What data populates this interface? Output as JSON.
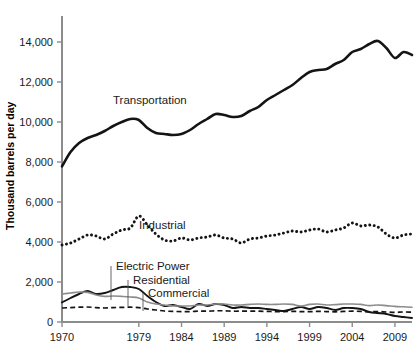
{
  "chart_data": {
    "type": "line",
    "title": "",
    "xlabel": "",
    "ylabel": "Thousand barrels per day",
    "xlim": [
      1970,
      2011
    ],
    "ylim": [
      0,
      15000
    ],
    "ytick_labels": [
      "0",
      "2,000",
      "4,000",
      "6,000",
      "8,000",
      "10,000",
      "12,000",
      "14,000"
    ],
    "ytick_values": [
      0,
      2000,
      4000,
      6000,
      8000,
      10000,
      12000,
      14000
    ],
    "xtick_labels": [
      "1970",
      "1979",
      "1984",
      "1989",
      "1994",
      "1999",
      "2004",
      "2009"
    ],
    "xtick_values": [
      1970,
      1979,
      1984,
      1989,
      1994,
      1999,
      2004,
      2009
    ],
    "grid": false,
    "legend_position": "inline-annotations",
    "x": [
      1970,
      1971,
      1972,
      1973,
      1974,
      1975,
      1976,
      1977,
      1978,
      1979,
      1980,
      1981,
      1982,
      1983,
      1984,
      1985,
      1986,
      1987,
      1988,
      1989,
      1990,
      1991,
      1992,
      1993,
      1994,
      1995,
      1996,
      1997,
      1998,
      1999,
      2000,
      2001,
      2002,
      2003,
      2004,
      2005,
      2006,
      2007,
      2008,
      2009,
      2010,
      2011
    ],
    "series": [
      {
        "name": "Transportation",
        "style": "solid-thick-black",
        "color": "#141414",
        "values": [
          7780,
          8500,
          8950,
          9200,
          9350,
          9550,
          9800,
          10000,
          10150,
          10100,
          9700,
          9450,
          9400,
          9350,
          9400,
          9600,
          9900,
          10150,
          10400,
          10350,
          10250,
          10300,
          10550,
          10750,
          11100,
          11350,
          11600,
          11850,
          12200,
          12500,
          12600,
          12650,
          12900,
          13100,
          13500,
          13650,
          13900,
          14050,
          13700,
          13200,
          13500,
          13350
        ]
      },
      {
        "name": "Industrial",
        "style": "dotted-black",
        "color": "#141414",
        "values": [
          3850,
          3950,
          4150,
          4350,
          4300,
          4150,
          4400,
          4600,
          4700,
          5300,
          4850,
          4400,
          4100,
          4050,
          4200,
          4100,
          4200,
          4250,
          4350,
          4200,
          4150,
          3950,
          4150,
          4200,
          4300,
          4350,
          4450,
          4550,
          4500,
          4600,
          4650,
          4500,
          4600,
          4700,
          4950,
          4800,
          4850,
          4750,
          4400,
          4200,
          4350,
          4400
        ]
      },
      {
        "name": "Electric Power",
        "style": "solid-black",
        "color": "#141414",
        "values": [
          980,
          1200,
          1400,
          1550,
          1400,
          1450,
          1600,
          1750,
          1750,
          1650,
          1300,
          1000,
          800,
          850,
          750,
          650,
          900,
          800,
          900,
          850,
          700,
          750,
          700,
          700,
          650,
          600,
          550,
          650,
          750,
          650,
          750,
          700,
          600,
          700,
          700,
          650,
          500,
          450,
          400,
          300,
          250,
          200
        ]
      },
      {
        "name": "Residential",
        "style": "solid-gray",
        "color": "#8c8c8c",
        "values": [
          1400,
          1450,
          1500,
          1480,
          1350,
          1280,
          1300,
          1280,
          1250,
          1200,
          1000,
          900,
          850,
          800,
          800,
          800,
          850,
          850,
          900,
          900,
          850,
          850,
          880,
          900,
          880,
          880,
          900,
          880,
          800,
          880,
          900,
          850,
          870,
          900,
          900,
          880,
          820,
          850,
          820,
          780,
          760,
          740
        ]
      },
      {
        "name": "Commercial",
        "style": "dashed-black",
        "color": "#141414",
        "values": [
          700,
          720,
          740,
          750,
          720,
          700,
          720,
          730,
          740,
          720,
          650,
          600,
          550,
          530,
          520,
          520,
          540,
          540,
          560,
          560,
          540,
          540,
          540,
          540,
          530,
          520,
          520,
          530,
          520,
          520,
          530,
          520,
          510,
          530,
          540,
          530,
          510,
          520,
          500,
          480,
          500,
          490
        ]
      }
    ]
  },
  "annotations": {
    "transportation": {
      "label": "Transportation"
    },
    "industrial": {
      "label": "Industrial"
    },
    "electric_power": {
      "label": "Electric Power"
    },
    "residential": {
      "label": "Residential"
    },
    "commercial": {
      "label": "Commercial"
    }
  }
}
